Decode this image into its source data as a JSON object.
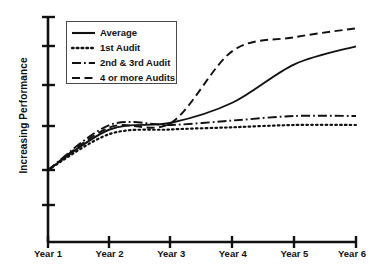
{
  "chart_data": {
    "type": "line",
    "title": "",
    "xlabel": "",
    "ylabel": "Increasing Performance",
    "categories": [
      "Year 1",
      "Year 2",
      "Year 3",
      "Year 4",
      "Year 5",
      "Year 6"
    ],
    "x_tick_labels": [
      "Year 1",
      "Year 2",
      "Year 3",
      "Year 4",
      "Year 5",
      "Year 6"
    ],
    "y_tick_labels": [],
    "y_axis_numeric": false,
    "ylim": [
      0,
      100
    ],
    "grid": false,
    "legend_position": "top-left",
    "series": [
      {
        "name": "Average",
        "style": "solid",
        "values": [
          32,
          50,
          53,
          62,
          79,
          87
        ]
      },
      {
        "name": "1st Audit",
        "style": "dotted",
        "values": [
          32,
          48,
          50,
          51,
          52,
          52
        ]
      },
      {
        "name": "2nd & 3rd Audit",
        "style": "dash-dot",
        "values": [
          32,
          52,
          52,
          54,
          56,
          56
        ]
      },
      {
        "name": "4 or more Audits",
        "style": "dashed",
        "values": [
          32,
          51,
          53,
          85,
          91,
          95
        ]
      }
    ],
    "annotations": [],
    "note": "Y axis is unlabeled and qualitative; values are estimated from pixel positions on a 0-100 relative scale."
  },
  "legend": {
    "items": [
      {
        "label": "Average",
        "style": "solid"
      },
      {
        "label": "1st Audit",
        "style": "dotted"
      },
      {
        "label": "2nd & 3rd Audit",
        "style": "dash-dot"
      },
      {
        "label": "4 or more Audits",
        "style": "dashed"
      }
    ]
  },
  "axes": {
    "y_title": "Increasing Performance",
    "line_color": "#111111"
  }
}
